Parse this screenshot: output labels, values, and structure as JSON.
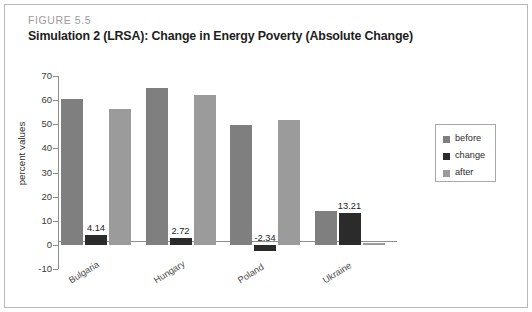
{
  "figure": {
    "label": "FIGURE 5.5",
    "title": "Simulation 2 (LRSA): Change in Energy Poverty (Absolute Change)"
  },
  "chart_data": {
    "type": "bar",
    "title": "Simulation 2 (LRSA): Change in Energy Poverty (Absolute Change)",
    "xlabel": "",
    "ylabel": "percent values",
    "ylim": [
      -10,
      70
    ],
    "ytick_step": 10,
    "yticks": [
      "70",
      "60",
      "50",
      "40",
      "30",
      "20",
      "10",
      "0",
      "-10"
    ],
    "grid": false,
    "legend_position": "right",
    "categories": [
      "Bulgaria",
      "Hungary",
      "Poland",
      "Ukraine"
    ],
    "series": [
      {
        "name": "before",
        "color": "#7f7f7f",
        "values": [
          60.5,
          65.1,
          49.8,
          14.0
        ]
      },
      {
        "name": "change",
        "color": "#2b2b2b",
        "values": [
          4.14,
          2.72,
          -2.34,
          13.21
        ]
      },
      {
        "name": "after",
        "color": "#9b9b9b",
        "values": [
          56.4,
          62.3,
          51.9,
          0.8
        ]
      }
    ],
    "data_labels": [
      "4.14",
      "2.72",
      "-2.34",
      "13.21"
    ],
    "data_label_series": "change"
  },
  "legend": {
    "items": [
      {
        "label": "before",
        "color": "#7f7f7f"
      },
      {
        "label": "change",
        "color": "#2b2b2b"
      },
      {
        "label": "after",
        "color": "#9b9b9b"
      }
    ]
  }
}
